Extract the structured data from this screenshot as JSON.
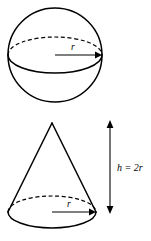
{
  "figure": {
    "background_color": "#ffffff",
    "stroke_color": "#000000",
    "width": 151,
    "height": 241,
    "shapes": [
      {
        "name": "sphere",
        "type": "sphere",
        "center": {
          "x": 55,
          "y": 55
        },
        "radius": 47,
        "equator": {
          "rx": 47,
          "ry": 18,
          "back_arc_style": "dashed",
          "front_arc_style": "solid"
        },
        "radius_label": "r"
      },
      {
        "name": "cone",
        "type": "cone",
        "apex": {
          "x": 52,
          "y": 123
        },
        "base_center": {
          "x": 52,
          "y": 212
        },
        "base_rx": 44,
        "base_ry": 16,
        "base_back_arc_style": "dashed",
        "base_front_arc_style": "solid",
        "radius_label": "r"
      }
    ],
    "dimension": {
      "name": "cone-height",
      "label": "h = 2r",
      "orientation": "vertical",
      "x": 110,
      "y_top": 122,
      "y_bottom": 212,
      "arrowheads": "both"
    }
  }
}
